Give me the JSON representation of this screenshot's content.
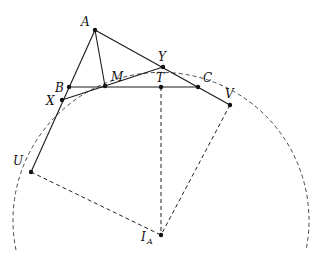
{
  "diagram": {
    "type": "geometry",
    "stroke_color": "#1a1a1a",
    "points": {
      "A": {
        "label": "A",
        "x": 95,
        "y": 30
      },
      "B": {
        "label": "B",
        "x": 69,
        "y": 87
      },
      "C": {
        "label": "C",
        "x": 198,
        "y": 87
      },
      "M": {
        "label": "M",
        "x": 105,
        "y": 86
      },
      "T": {
        "label": "T",
        "x": 161,
        "y": 87
      },
      "X": {
        "label": "X",
        "x": 62,
        "y": 100
      },
      "Y": {
        "label": "Y",
        "x": 163,
        "y": 67
      },
      "U": {
        "label": "U",
        "x": 31,
        "y": 172
      },
      "V": {
        "label": "V",
        "x": 230,
        "y": 105
      },
      "IA": {
        "label": "I",
        "subscript": "A",
        "x": 161,
        "y": 235
      }
    },
    "solid_segments": [
      "A-U",
      "A-V",
      "B-C",
      "A-M",
      "X-Y"
    ],
    "dashed_segments": [
      "U-IA",
      "T-IA",
      "V-IA"
    ],
    "circle": {
      "center": "IA",
      "radius": 148,
      "style": "dashed",
      "partial": "upper arc"
    }
  }
}
